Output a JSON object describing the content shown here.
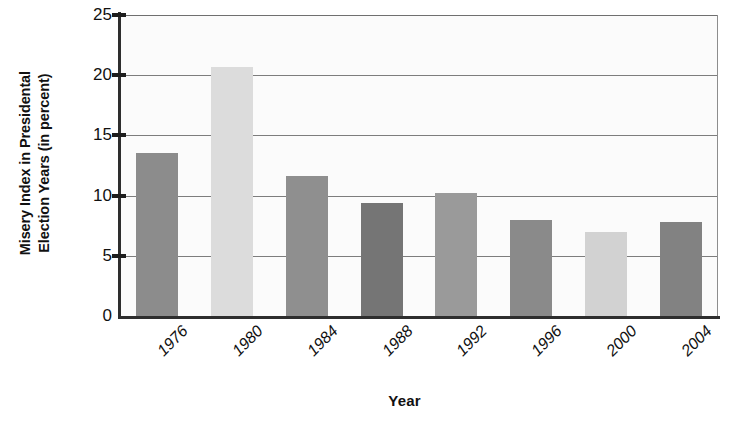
{
  "chart_data": {
    "type": "bar",
    "title": "",
    "xlabel": "Year",
    "ylabel_line1": "Misery Index in Presidental",
    "ylabel_line2": "Election Years (in percent)",
    "categories": [
      "1976",
      "1980",
      "1984",
      "1988",
      "1992",
      "1996",
      "2000",
      "2004"
    ],
    "values": [
      13.5,
      20.7,
      11.6,
      9.4,
      10.2,
      8.0,
      7.0,
      7.8
    ],
    "bar_colors": [
      "#8c8c8c",
      "#dcdcdc",
      "#8f8f8f",
      "#757575",
      "#9a9a9a",
      "#8a8a8a",
      "#d2d2d2",
      "#828282"
    ],
    "ylim": [
      0,
      25
    ],
    "yticks": [
      0,
      5,
      10,
      15,
      20,
      25
    ],
    "ytick_labels": [
      "0",
      "5",
      "10",
      "15",
      "20",
      "25"
    ],
    "grid": true,
    "grid_axis": "y",
    "legend": "none",
    "axis_color": "#2e2e2e",
    "gridline_color": "#7d7d7d",
    "plot_background": "#fbfbfb"
  }
}
